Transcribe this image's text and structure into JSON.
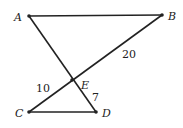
{
  "diagram": {
    "points": {
      "A": {
        "label": "A",
        "x": 29,
        "y": 16
      },
      "B": {
        "label": "B",
        "x": 162,
        "y": 15
      },
      "C": {
        "label": "C",
        "x": 29,
        "y": 112
      },
      "D": {
        "label": "D",
        "x": 96,
        "y": 112
      },
      "E": {
        "label": "E",
        "x": 72,
        "y": 80
      }
    },
    "segments": [
      "AB",
      "AD",
      "BC",
      "CD"
    ],
    "measures": {
      "EB": "20",
      "CE": "10",
      "ED": "7"
    },
    "stroke_color": "#222222"
  }
}
